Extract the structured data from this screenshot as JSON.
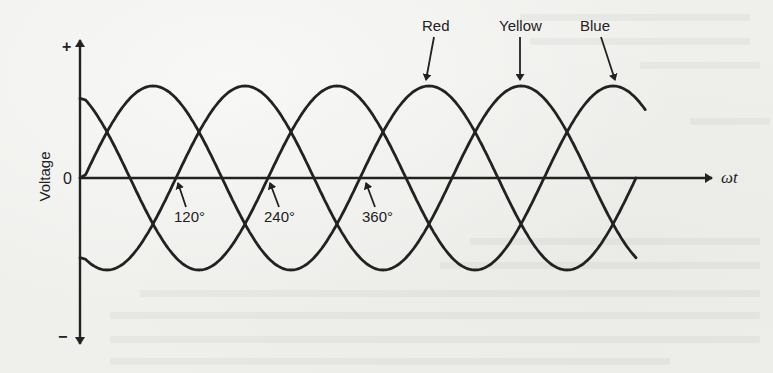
{
  "figure": {
    "y_axis": {
      "label": "Voltage",
      "positive_sign": "+",
      "negative_sign": "−",
      "zero_label": "0"
    },
    "x_axis": {
      "label": "ωt"
    },
    "phase_labels": [
      {
        "text": "Red",
        "phase_shift_deg": 0
      },
      {
        "text": "Yellow",
        "phase_shift_deg": -120
      },
      {
        "text": "Blue",
        "phase_shift_deg": 120
      }
    ],
    "angle_markers": [
      {
        "text": "120°",
        "angle_deg": 120
      },
      {
        "text": "240°",
        "angle_deg": 240
      },
      {
        "text": "360°",
        "angle_deg": 360
      }
    ],
    "style": {
      "line_color": "#222222",
      "background": "#efefec"
    }
  },
  "chart_data": {
    "type": "line",
    "title": "",
    "xlabel": "ωt",
    "ylabel": "Voltage",
    "x_unit": "degrees",
    "x_range": [
      0,
      730
    ],
    "y_ticks": [
      "+",
      "0",
      "−"
    ],
    "x_markers": [
      120,
      240,
      360
    ],
    "amplitude": 1,
    "series": [
      {
        "name": "Red",
        "function": "sin(ωt)",
        "phase_deg": 0
      },
      {
        "name": "Yellow",
        "function": "sin(ωt − 120°)",
        "phase_deg": -120
      },
      {
        "name": "Blue",
        "function": "sin(ωt + 120°)",
        "phase_deg": 120
      }
    ],
    "grid": false,
    "legend": "arrow annotations above peaks (Red, Yellow, Blue)"
  }
}
